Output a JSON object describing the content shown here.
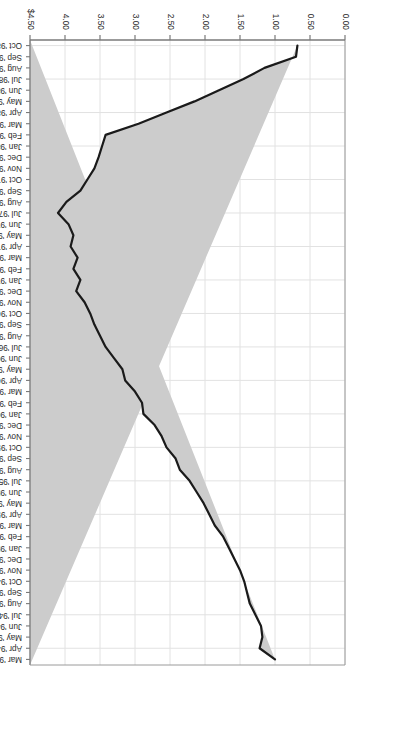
{
  "page": {
    "orientation": "rotated-180",
    "background_color": "#ffffff"
  },
  "chart_data": {
    "type": "area",
    "title": "",
    "subtitle": "",
    "xlabel": "",
    "ylabel": "",
    "orientation": "horizontal-bands",
    "grid": true,
    "legend_position": "none",
    "series_name": "",
    "value_axis": {
      "name": "value-axis",
      "ticks": [
        "$4.50",
        "4.00",
        "3.50",
        "3.00",
        "2.50",
        "2.00",
        "1.50",
        "1.00",
        "0.50",
        "0.00"
      ],
      "tick_values": [
        4.5,
        4.0,
        3.5,
        3.0,
        2.5,
        2.0,
        1.5,
        1.0,
        0.5,
        0.0
      ],
      "range": [
        4.5,
        0.0
      ],
      "reversed": true,
      "currency_prefix": "$"
    },
    "category_axis": {
      "name": "month-axis",
      "label_order": "newest-first"
    },
    "categories": [
      "Oct '98",
      "Sep '98",
      "Aug '98",
      "Jul '98",
      "Jun '98",
      "May '98",
      "Apr '98",
      "Mar '98",
      "Feb '98",
      "Jan '98",
      "Dec '97",
      "Nov '97",
      "Oct '97",
      "Sep '97",
      "Aug '97",
      "Jul '97",
      "Jun '97",
      "May '97",
      "Apr '97",
      "Mar '97",
      "Feb '97",
      "Jan '97",
      "Dec '96",
      "Nov '96",
      "Oct '96",
      "Sep '96",
      "Aug '96",
      "Jul '96",
      "Jun '96",
      "May '96",
      "Apr '96",
      "Mar '96",
      "Feb '96",
      "Jan '96",
      "Dec '95",
      "Nov '95",
      "Oct '95",
      "Sep '95",
      "Aug '95",
      "Jul '95",
      "Jun '95",
      "May '95",
      "Apr '95",
      "Mar '95",
      "Feb '95",
      "Jan '95",
      "Dec '94",
      "Nov '94",
      "Oct '94",
      "Sep '94",
      "Aug '94",
      "Jul '94",
      "Jun '94",
      "May '94",
      "Apr '94",
      "Mar '94"
    ],
    "values": [
      0.68,
      0.7,
      1.15,
      1.45,
      1.8,
      2.15,
      2.55,
      2.95,
      3.42,
      3.47,
      3.52,
      3.58,
      3.68,
      3.78,
      3.98,
      4.1,
      3.95,
      3.88,
      3.92,
      3.82,
      3.88,
      3.78,
      3.84,
      3.72,
      3.64,
      3.58,
      3.5,
      3.42,
      3.3,
      3.18,
      3.14,
      3.0,
      2.9,
      2.88,
      2.72,
      2.62,
      2.55,
      2.42,
      2.36,
      2.22,
      2.12,
      2.02,
      1.94,
      1.86,
      1.74,
      1.66,
      1.58,
      1.5,
      1.44,
      1.4,
      1.36,
      1.28,
      1.2,
      1.18,
      1.22,
      1.0
    ],
    "style": {
      "fill_color": "#cccccc",
      "line_color": "#1a1a1a",
      "line_width": 2.2,
      "plot_background": "#ffffff",
      "grid_color": "#e2e2e2",
      "axis_color": "#7a7a7a"
    }
  }
}
